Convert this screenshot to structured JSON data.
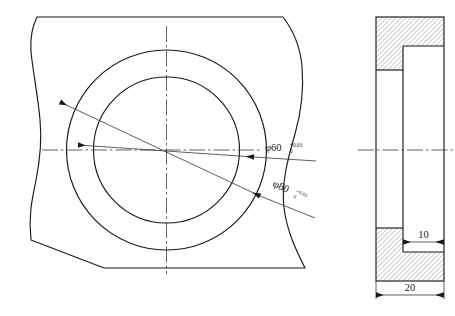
{
  "drawing": {
    "title": "Mechanical part engineering drawing",
    "views": {
      "front": {
        "name": "front-view",
        "description": "Front view showing two concentric circles on a curved-profile body"
      },
      "side": {
        "name": "side-section-view",
        "description": "Side sectional view with hatched cut material"
      }
    },
    "dimensions": {
      "bore_inner": {
        "symbol": "φ60",
        "tolerance_upper": "+0.03",
        "tolerance_lower": "0",
        "label_full": "φ60 +0.03 / 0"
      },
      "bore_outer": {
        "symbol": "φ80",
        "tolerance_upper": "+0.03",
        "tolerance_lower": "0",
        "label_full": "φ80 +0.03 / 0"
      },
      "groove_width": {
        "value": "10"
      },
      "overall_thickness": {
        "value": "20"
      }
    },
    "colors": {
      "line": "#1a1a1a",
      "centerline": "#3a3a3a",
      "hatch": "#8c8c8c",
      "background": "#ffffff"
    }
  }
}
